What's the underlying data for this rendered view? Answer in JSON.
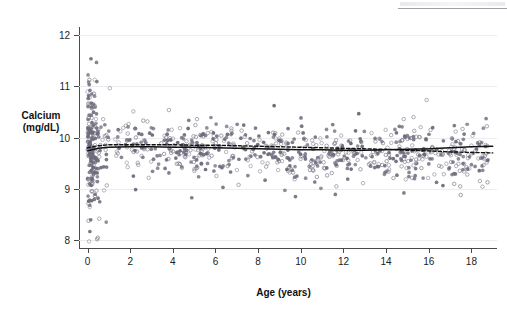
{
  "figure": {
    "axis_title_y_line1": "Calcium",
    "axis_title_y_line2": "(mg/dL)",
    "axis_title_x": "Age (years)"
  },
  "chart_data": {
    "type": "scatter",
    "title": "",
    "xlabel": "Age (years)",
    "ylabel": "Calcium (mg/dL)",
    "xlim": [
      -0.4,
      19.2
    ],
    "ylim": [
      7.85,
      12.15
    ],
    "xticks": [
      0,
      2,
      4,
      6,
      8,
      10,
      12,
      14,
      16,
      18
    ],
    "xtick_labels": [
      "0",
      "2",
      "4",
      "6",
      "8",
      "10",
      "12",
      "14",
      "16",
      "18"
    ],
    "yticks": [
      8,
      9,
      10,
      11,
      12
    ],
    "ytick_labels": [
      "8",
      "9",
      "10",
      "11",
      "12"
    ],
    "grid": "horizontal-faint",
    "legend": "none",
    "marker_colors": {
      "filled": "#6e6a7c",
      "open_stroke": "#8a8694",
      "open_fill": "none"
    },
    "line_colors": {
      "solid": "#111111",
      "dashed": "#111111"
    },
    "series": [
      {
        "name": "filled-circles",
        "marker": "filled-circle",
        "n": 470,
        "color": "#6e6a7c"
      },
      {
        "name": "open-circles",
        "marker": "open-circle",
        "n": 430,
        "color": "#8a8694"
      }
    ],
    "trend_lines": [
      {
        "name": "solid-smooth",
        "style": "solid",
        "x": [
          0.0,
          0.5,
          1.0,
          2.0,
          3.0,
          4.0,
          5.0,
          6.0,
          7.0,
          8.0,
          9.0,
          10.0,
          11.0,
          12.0,
          13.0,
          14.0,
          15.0,
          16.0,
          17.0,
          18.0,
          19.0
        ],
        "y": [
          9.74,
          9.79,
          9.81,
          9.82,
          9.82,
          9.81,
          9.81,
          9.8,
          9.79,
          9.78,
          9.77,
          9.76,
          9.76,
          9.75,
          9.75,
          9.76,
          9.77,
          9.78,
          9.8,
          9.82,
          9.83
        ]
      },
      {
        "name": "dashed-smooth",
        "style": "dashed",
        "x": [
          0.0,
          0.5,
          1.0,
          2.0,
          3.0,
          4.0,
          5.0,
          6.0,
          7.0,
          8.0,
          9.0,
          10.0,
          11.0,
          12.0,
          13.0,
          14.0,
          15.0,
          16.0,
          17.0,
          18.0,
          19.0
        ],
        "y": [
          9.8,
          9.84,
          9.86,
          9.86,
          9.86,
          9.86,
          9.85,
          9.85,
          9.84,
          9.83,
          9.82,
          9.81,
          9.8,
          9.79,
          9.78,
          9.77,
          9.75,
          9.74,
          9.72,
          9.71,
          9.7
        ]
      }
    ]
  }
}
